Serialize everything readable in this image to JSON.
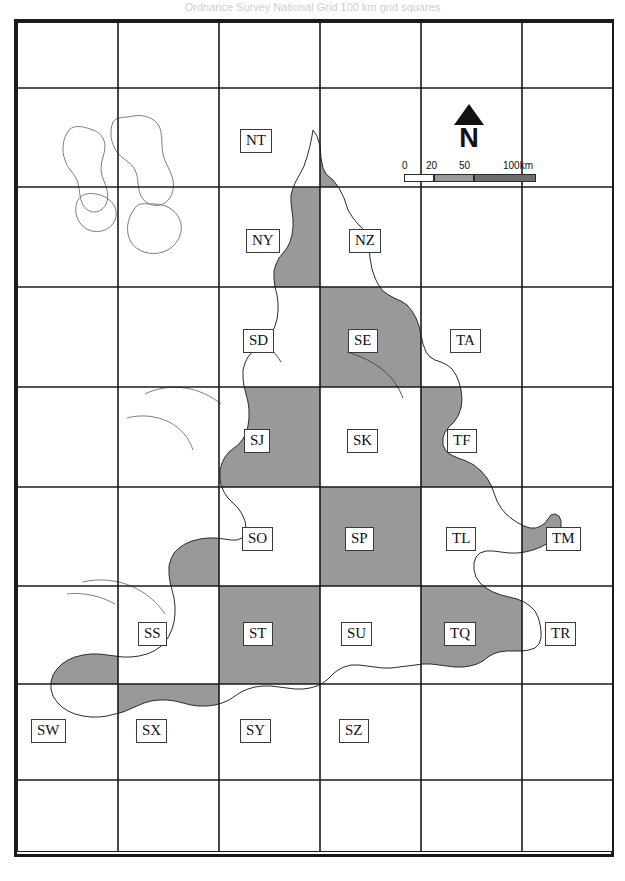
{
  "figure": {
    "title_fragment": "Ordnance Survey National Grid  100 km grid squares",
    "kind": "reference-map"
  },
  "legend": {
    "north_label": "N",
    "scale_unit_label": "100km",
    "scale_ticks": [
      "0",
      "20",
      "50",
      "100km"
    ],
    "scale_segments": [
      {
        "from": 0,
        "to": 20,
        "fill": "#ffffff"
      },
      {
        "from": 20,
        "to": 50,
        "fill": "#9a9a9a"
      },
      {
        "from": 50,
        "to": 100,
        "fill": "#6e6e6e"
      }
    ]
  },
  "colors": {
    "land_shaded": "#999999",
    "land_unshaded": "#ffffff",
    "coastline": "#2b2b2b",
    "grid_line": "#1a1a1a",
    "frame": "#1a1a1a",
    "label_text": "#111111"
  },
  "grid": {
    "origin_x": 17,
    "origin_y": 22,
    "cell_width": 100,
    "cell_height": 99.5,
    "columns": 6,
    "rows": 8,
    "vertical_lines": [
      17,
      118,
      219,
      320,
      421,
      522,
      613
    ],
    "horizontal_lines": [
      22,
      88,
      187,
      287,
      387,
      487,
      586,
      684,
      780,
      852
    ]
  },
  "squares": [
    {
      "code": "NT",
      "x": 240,
      "y": 129,
      "shaded": false
    },
    {
      "code": "NY",
      "x": 246,
      "y": 229,
      "shaded": true
    },
    {
      "code": "NZ",
      "x": 349,
      "y": 229,
      "shaded": true
    },
    {
      "code": "SD",
      "x": 243,
      "y": 329,
      "shaded": true
    },
    {
      "code": "SE",
      "x": 348,
      "y": 329,
      "shaded": true
    },
    {
      "code": "TA",
      "x": 450,
      "y": 329,
      "shaded": false
    },
    {
      "code": "SJ",
      "x": 244,
      "y": 429,
      "shaded": true
    },
    {
      "code": "SK",
      "x": 347,
      "y": 429,
      "shaded": true
    },
    {
      "code": "TF",
      "x": 447,
      "y": 429,
      "shaded": true
    },
    {
      "code": "SO",
      "x": 242,
      "y": 527,
      "shaded": true
    },
    {
      "code": "SP",
      "x": 345,
      "y": 527,
      "shaded": true
    },
    {
      "code": "TL",
      "x": 446,
      "y": 527,
      "shaded": true
    },
    {
      "code": "TM",
      "x": 546,
      "y": 527,
      "shaded": true
    },
    {
      "code": "SS",
      "x": 138,
      "y": 622,
      "shaded": true
    },
    {
      "code": "ST",
      "x": 243,
      "y": 622,
      "shaded": true
    },
    {
      "code": "SU",
      "x": 341,
      "y": 622,
      "shaded": true
    },
    {
      "code": "TQ",
      "x": 444,
      "y": 622,
      "shaded": true
    },
    {
      "code": "TR",
      "x": 545,
      "y": 622,
      "shaded": true
    },
    {
      "code": "SW",
      "x": 31,
      "y": 719,
      "shaded": true
    },
    {
      "code": "SX",
      "x": 136,
      "y": 719,
      "shaded": true
    },
    {
      "code": "SY",
      "x": 240,
      "y": 719,
      "shaded": false
    },
    {
      "code": "SZ",
      "x": 339,
      "y": 719,
      "shaded": false
    }
  ]
}
